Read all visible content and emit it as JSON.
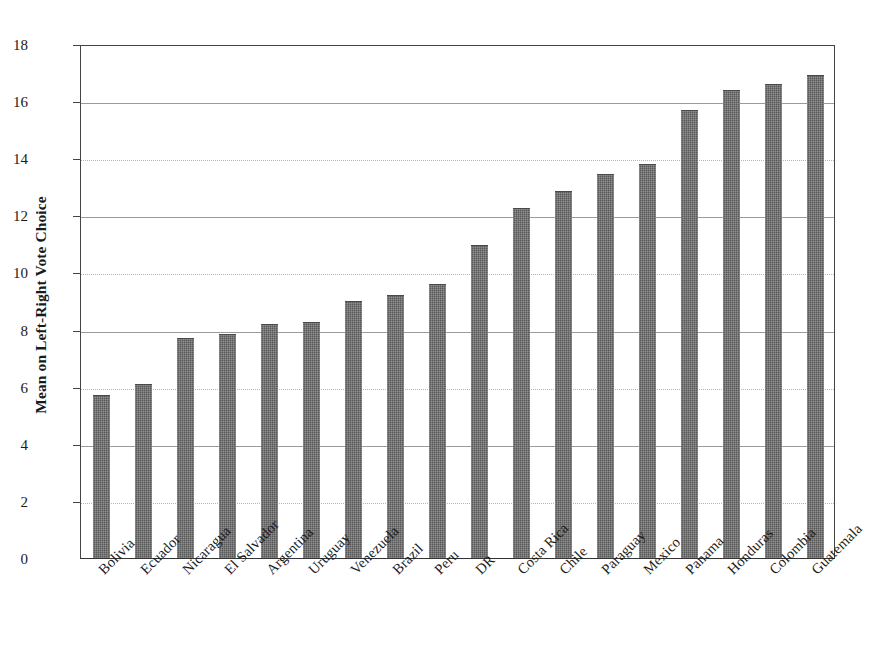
{
  "chart_data": {
    "type": "bar",
    "title": "",
    "xlabel": "",
    "ylabel": "Mean on Left-Right Vote Choice",
    "ylim": [
      0,
      18
    ],
    "y_ticks": [
      0,
      2,
      4,
      6,
      8,
      10,
      12,
      14,
      16,
      18
    ],
    "grid": true,
    "legend": "none",
    "orientation": "vertical",
    "bar_color": "#595959",
    "categories": [
      "Bolivia",
      "Ecuador",
      "Nicaragua",
      "El Salvador",
      "Argentina",
      "Uruguay",
      "Venezuela",
      "Brazil",
      "Peru",
      "DR",
      "Costa Rica",
      "Chile",
      "Paraguay",
      "Mexico",
      "Panama",
      "Honduras",
      "Colombia",
      "Guatemala"
    ],
    "values": [
      5.7,
      6.1,
      7.7,
      7.85,
      8.2,
      8.25,
      9.0,
      9.2,
      9.6,
      10.95,
      12.25,
      12.85,
      13.45,
      13.8,
      15.7,
      16.4,
      16.6,
      16.9
    ]
  }
}
